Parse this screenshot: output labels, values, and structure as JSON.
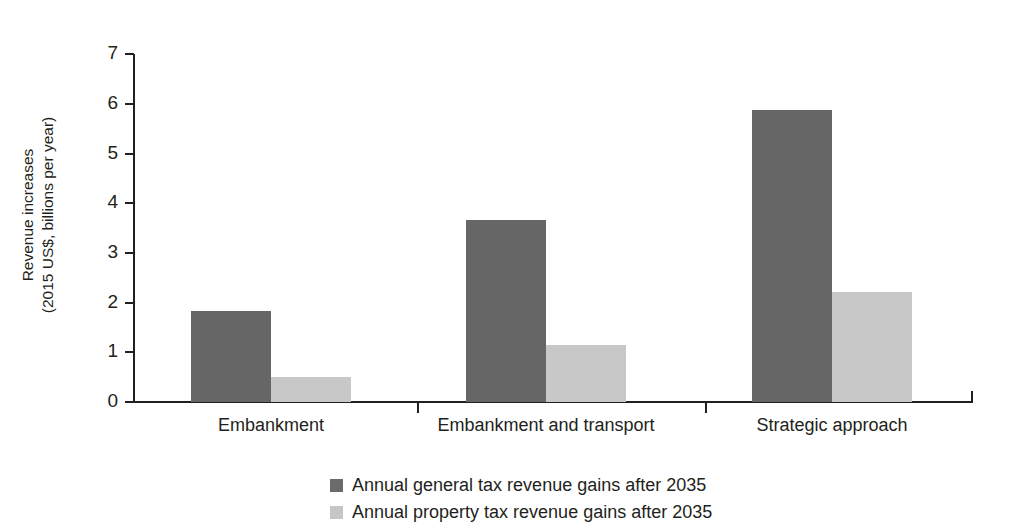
{
  "chart_data": {
    "type": "bar",
    "title": "",
    "xlabel": "",
    "ylabel": "Revenue increases\n(2015 US$, billions per year)",
    "ylim": [
      0,
      7
    ],
    "ytick_labels": [
      "7",
      "6",
      "5",
      "4",
      "3",
      "2",
      "1",
      "0"
    ],
    "ytick_values": [
      7,
      6,
      5,
      4,
      3,
      2,
      1,
      0
    ],
    "grid": false,
    "legend_position": "bottom",
    "categories": [
      "Embankment",
      "Embankment and transport",
      "Strategic approach"
    ],
    "series": [
      {
        "name": "Annual general tax revenue gains after 2035",
        "color": "#666666",
        "legend_color": "#6b6b6b",
        "values": [
          1.83,
          3.66,
          5.87
        ]
      },
      {
        "name": "Annual property tax revenue gains after 2035",
        "color": "#c8c8c8",
        "legend_color": "#c6c6c6",
        "values": [
          0.51,
          1.14,
          2.21
        ]
      }
    ]
  },
  "legend": {
    "items": [
      {
        "label": "Annual general tax revenue gains after 2035"
      },
      {
        "label": "Annual property tax revenue gains after 2035"
      }
    ]
  }
}
